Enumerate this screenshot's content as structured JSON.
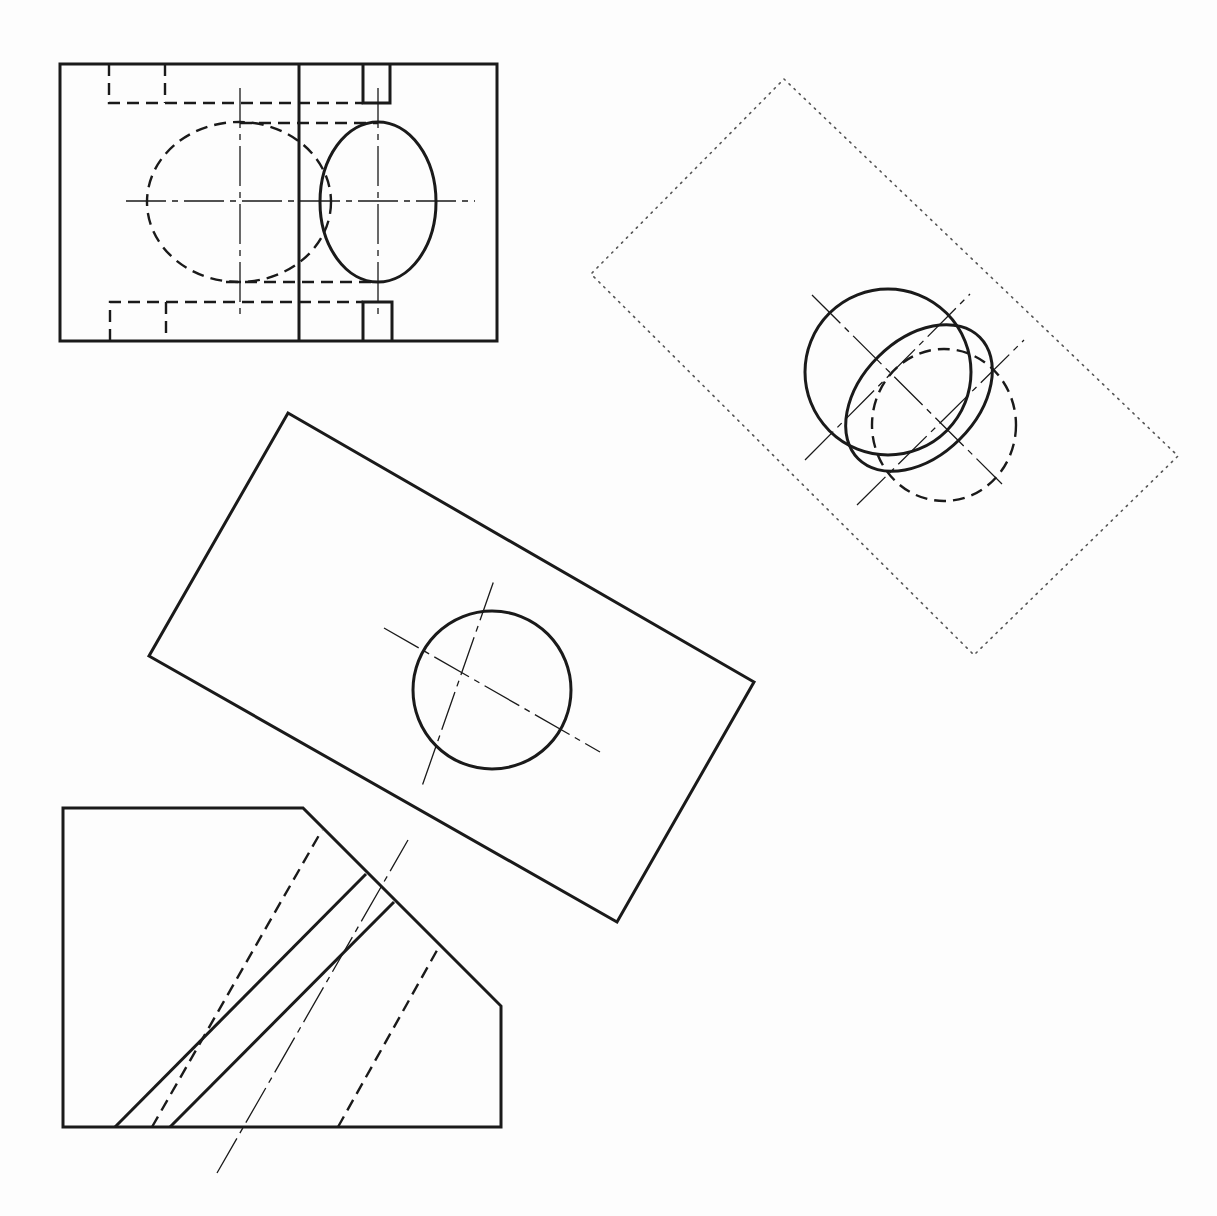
{
  "figure": {
    "type": "engineering orthographic and auxiliary views",
    "top_caption_cutoff": "",
    "stroke_color": "#1a1a1a",
    "background": "#fdfdfd"
  },
  "views": [
    {
      "name": "top-view",
      "description": "Rectangular plan view with hidden slots and elliptical hole projections"
    },
    {
      "name": "secondary-auxiliary-view",
      "description": "Dotted rotated boundary with two overlapping ellipses"
    },
    {
      "name": "primary-auxiliary-view",
      "description": "Rotated rectangle showing true-size circular hole"
    },
    {
      "name": "front-view",
      "description": "Pentagon-shaped profile with inclined hole lines"
    }
  ]
}
